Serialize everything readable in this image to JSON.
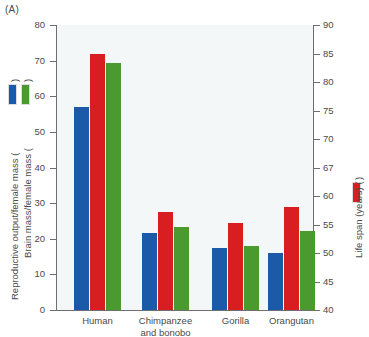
{
  "panel": {
    "label": "(A)"
  },
  "axes": {
    "left": {
      "title_1": "Reproductive output/female mass (",
      "title_1_close": ")",
      "title_2": "Brain mass/female mass (",
      "title_2_close": ")",
      "ticks": [
        "0",
        "10",
        "20",
        "30",
        "40",
        "50",
        "60",
        "70",
        "80"
      ],
      "min": 0,
      "max": 80
    },
    "right": {
      "title": "Life span (years) (",
      "title_close": ")",
      "ticks": [
        "40",
        "45",
        "50",
        "55",
        "60",
        "67",
        "70",
        "75",
        "80",
        "85",
        "90"
      ],
      "min": 40,
      "max": 90
    }
  },
  "legend": {
    "blue_label": "Reproductive output/female mass",
    "green_label": "Brain mass/female mass",
    "red_label": "Life span (years)",
    "blue_color": "#1a5aa8",
    "red_color": "#d81e20",
    "green_color": "#4a9a2f"
  },
  "chart_data": {
    "type": "bar",
    "title": "(A)",
    "xlabel": "",
    "ylabel": "Reproductive output/female mass    Brain mass/female mass",
    "ylabel_right": "Life span (years)",
    "ylim": [
      0,
      80
    ],
    "ylim_right": [
      40,
      90
    ],
    "grid": false,
    "legend_position": "axis-labels",
    "categories": [
      "Human",
      "Chimpanzee and bonobo",
      "Gorilla",
      "Orangutan"
    ],
    "category_lines": [
      [
        "Human"
      ],
      [
        "Chimpanzee",
        "and bonobo"
      ],
      [
        "Gorilla"
      ],
      [
        "Orangutan"
      ]
    ],
    "series": [
      {
        "name": "Reproductive output/female mass",
        "color": "#1a5aa8",
        "axis": "left",
        "values": [
          57.0,
          21.5,
          17.3,
          16.0
        ]
      },
      {
        "name": "Life span (years)",
        "color": "#d81e20",
        "axis": "right",
        "values": [
          84.0,
          57.5,
          55.5,
          58.8
        ],
        "values_left_scale": [
          71.8,
          27.5,
          24.5,
          28.8
        ]
      },
      {
        "name": "Brain mass/female mass",
        "color": "#4a9a2f",
        "axis": "left",
        "values": [
          69.4,
          23.2,
          18.0,
          22.2
        ]
      }
    ]
  }
}
